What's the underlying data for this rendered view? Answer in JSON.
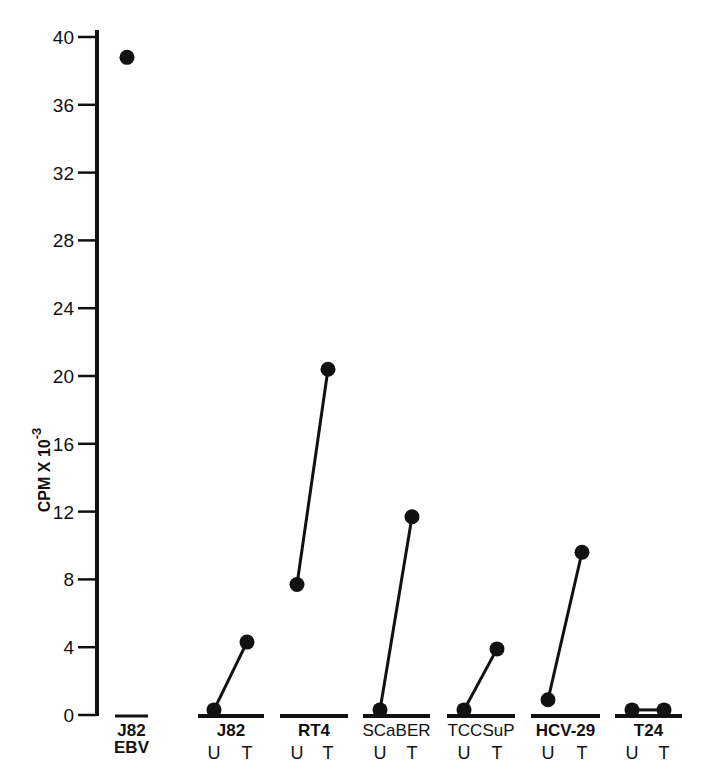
{
  "chart_data": {
    "type": "line",
    "title": "",
    "xlabel": "",
    "ylabel": "CPM X 10",
    "ylabel_exponent": "-3",
    "ylim": [
      0,
      40
    ],
    "yticks": [
      0,
      4,
      8,
      12,
      16,
      20,
      24,
      28,
      32,
      36,
      40
    ],
    "grid": false,
    "legend": null,
    "categories": [
      {
        "name": "J82",
        "sub": "EBV",
        "conditions": [
          "EBV"
        ],
        "values": [
          38.8
        ]
      },
      {
        "name": "J82",
        "sub": "",
        "conditions": [
          "U",
          "T"
        ],
        "values": [
          0.3,
          4.3
        ]
      },
      {
        "name": "RT4",
        "sub": "",
        "conditions": [
          "U",
          "T"
        ],
        "values": [
          7.7,
          20.4
        ]
      },
      {
        "name": "SCaBER",
        "sub": "",
        "conditions": [
          "U",
          "T"
        ],
        "values": [
          0.3,
          11.7
        ]
      },
      {
        "name": "TCCSuP",
        "sub": "",
        "conditions": [
          "U",
          "T"
        ],
        "values": [
          0.3,
          3.9
        ]
      },
      {
        "name": "HCV-29",
        "sub": "",
        "conditions": [
          "U",
          "T"
        ],
        "values": [
          0.9,
          9.6
        ]
      },
      {
        "name": "T24",
        "sub": "",
        "conditions": [
          "U",
          "T"
        ],
        "values": [
          0.3,
          0.3
        ]
      }
    ],
    "condition_legend": {
      "U": "untreated",
      "T": "treated"
    }
  },
  "axis": {
    "y_ticks": [
      "0",
      "4",
      "8",
      "12",
      "16",
      "20",
      "24",
      "28",
      "32",
      "36",
      "40"
    ],
    "ylabel_main": "CPM X 10",
    "ylabel_exp": "-3"
  },
  "groups": [
    {
      "label": "J82",
      "sub": "EBV"
    },
    {
      "label": "J82",
      "u": "U",
      "t": "T"
    },
    {
      "label": "RT4",
      "u": "U",
      "t": "T"
    },
    {
      "label": "SCaBER",
      "u": "U",
      "t": "T"
    },
    {
      "label": "TCCSuP",
      "u": "U",
      "t": "T"
    },
    {
      "label": "HCV-29",
      "u": "U",
      "t": "T"
    },
    {
      "label": "T24",
      "u": "U",
      "t": "T"
    }
  ],
  "colors": {
    "ink": "#111111",
    "background": "#ffffff"
  }
}
